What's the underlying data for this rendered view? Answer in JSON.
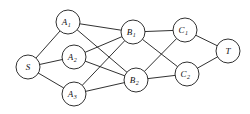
{
  "diagram": {
    "type": "directed-layered-graph",
    "background_color": "#ffffff",
    "stroke_color": "#1a1a1a",
    "node_fill": "#ffffff",
    "node_radius": 12,
    "nodes": [
      {
        "id": "S",
        "base": "S",
        "sub": "",
        "cx": 28,
        "cy": 67,
        "r": 12,
        "layer": "source"
      },
      {
        "id": "A1",
        "base": "A",
        "sub": "1",
        "cx": 68,
        "cy": 22,
        "r": 12,
        "layer": "A"
      },
      {
        "id": "A2",
        "base": "A",
        "sub": "2",
        "cx": 74,
        "cy": 57,
        "r": 12,
        "layer": "A"
      },
      {
        "id": "A3",
        "base": "A",
        "sub": "3",
        "cx": 74,
        "cy": 94,
        "r": 12,
        "layer": "A"
      },
      {
        "id": "B1",
        "base": "B",
        "sub": "1",
        "cx": 133,
        "cy": 32,
        "r": 12,
        "layer": "B"
      },
      {
        "id": "B2",
        "base": "B",
        "sub": "2",
        "cx": 136,
        "cy": 80,
        "r": 12,
        "layer": "B"
      },
      {
        "id": "C1",
        "base": "C",
        "sub": "1",
        "cx": 185,
        "cy": 30,
        "r": 12,
        "layer": "C"
      },
      {
        "id": "C2",
        "base": "C",
        "sub": "2",
        "cx": 187,
        "cy": 74,
        "r": 12,
        "layer": "C"
      },
      {
        "id": "T",
        "base": "T",
        "sub": "",
        "cx": 228,
        "cy": 51,
        "r": 12,
        "layer": "sink"
      }
    ],
    "edges": [
      {
        "from": "S",
        "to": "A1"
      },
      {
        "from": "S",
        "to": "A2"
      },
      {
        "from": "S",
        "to": "A3"
      },
      {
        "from": "A1",
        "to": "B1"
      },
      {
        "from": "A1",
        "to": "B2"
      },
      {
        "from": "A2",
        "to": "B1"
      },
      {
        "from": "A2",
        "to": "B2"
      },
      {
        "from": "A3",
        "to": "B1"
      },
      {
        "from": "A3",
        "to": "B2"
      },
      {
        "from": "B1",
        "to": "C1"
      },
      {
        "from": "B1",
        "to": "C2"
      },
      {
        "from": "B2",
        "to": "C1"
      },
      {
        "from": "B2",
        "to": "C2"
      },
      {
        "from": "C1",
        "to": "T"
      },
      {
        "from": "C2",
        "to": "T"
      }
    ]
  }
}
